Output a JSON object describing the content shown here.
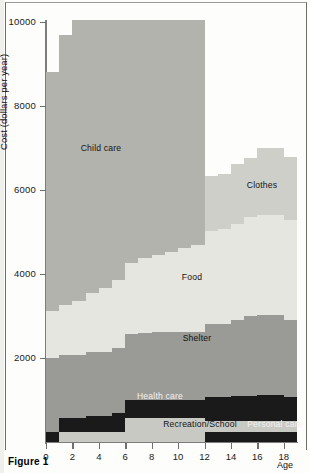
{
  "figure": {
    "caption": "Figure 1"
  },
  "chart_data": {
    "type": "area",
    "title": "",
    "subtitle": "",
    "xlabel": "Age",
    "ylabel": "Cost (dollars per year)",
    "stacked": true,
    "grid": false,
    "legend_position": "inline-labels",
    "xlim": [
      0,
      19
    ],
    "ylim": [
      0,
      10000
    ],
    "xticks": [
      0,
      2,
      4,
      6,
      8,
      10,
      12,
      14,
      16,
      18
    ],
    "xticklabels": [
      "0",
      "2",
      "4",
      "6",
      "8",
      "10",
      "12",
      "14",
      "16",
      "18"
    ],
    "yticks": [
      2000,
      4000,
      6000,
      8000,
      10000
    ],
    "yticklabels": [
      "2000",
      "4000",
      "6000",
      "8000",
      "10000"
    ],
    "x": [
      0,
      1,
      2,
      3,
      4,
      5,
      6,
      7,
      8,
      9,
      10,
      11,
      12,
      13,
      14,
      15,
      16,
      17,
      18
    ],
    "series": [
      {
        "name": "Personal care",
        "color": "#1a1a1a",
        "label_text": "Personal care",
        "values": [
          230,
          0,
          0,
          0,
          0,
          0,
          0,
          0,
          0,
          0,
          0,
          0,
          250,
          250,
          250,
          250,
          250,
          250,
          250
        ]
      },
      {
        "name": "Recreation/School",
        "color": "#c9c9c4",
        "label_text": "Recreation/School",
        "values": [
          0,
          250,
          250,
          250,
          250,
          250,
          560,
          560,
          560,
          560,
          560,
          560,
          250,
          250,
          250,
          250,
          250,
          250,
          250
        ]
      },
      {
        "name": "Health care",
        "color": "#1a1a1a",
        "label_text": "Health care",
        "values": [
          0,
          320,
          320,
          380,
          380,
          430,
          430,
          430,
          430,
          430,
          430,
          430,
          560,
          560,
          600,
          600,
          620,
          620,
          560
        ]
      },
      {
        "name": "Shelter",
        "color": "#9a9a96",
        "label_text": "Shelter",
        "values": [
          1780,
          1510,
          1510,
          1510,
          1520,
          1560,
          1580,
          1600,
          1620,
          1620,
          1620,
          1620,
          1740,
          1740,
          1800,
          1900,
          1900,
          1900,
          1840
        ]
      },
      {
        "name": "Food",
        "color": "#e6e6e1",
        "label_text": "Food",
        "values": [
          1100,
          1180,
          1270,
          1400,
          1520,
          1620,
          1700,
          1780,
          1850,
          1920,
          2000,
          2080,
          2230,
          2280,
          2300,
          2350,
          2380,
          2380,
          2380
        ]
      },
      {
        "name": "Clothes",
        "color": "#cfcfca",
        "label_text": "Clothes",
        "values": [
          0,
          0,
          0,
          0,
          0,
          0,
          0,
          0,
          0,
          0,
          0,
          0,
          1300,
          1300,
          1420,
          1420,
          1600,
          1600,
          1500
        ]
      },
      {
        "name": "Child care",
        "color": "#b3b3ae",
        "label_text": "Child care",
        "values": [
          5690,
          6440,
          9080,
          7950,
          8030,
          7660,
          7760,
          7350,
          6930,
          6890,
          6680,
          6420,
          0,
          0,
          0,
          0,
          0,
          0,
          0
        ]
      }
    ],
    "band_label_positions": [
      {
        "name": "Child care",
        "x": 101,
        "y": 148
      },
      {
        "name": "Clothes",
        "x": 262,
        "y": 185
      },
      {
        "name": "Food",
        "x": 192,
        "y": 277
      },
      {
        "name": "Shelter",
        "x": 197,
        "y": 338
      },
      {
        "name": "Health care",
        "x": 160,
        "y": 396
      },
      {
        "name": "Recreation/School",
        "x": 200,
        "y": 424
      },
      {
        "name": "Personal care",
        "x": 275,
        "y": 424
      }
    ]
  }
}
